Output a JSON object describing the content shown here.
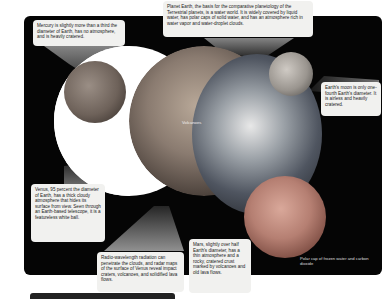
{
  "figure": {
    "callouts": {
      "mercury": "Mercury is slightly more than a third the diameter of Earth, has no atmosphere, and is heavily cratered.",
      "earth": "Planet Earth, the basis for the comparative planetology of the Terrestrial planets, is a water world. It is widely covered by liquid water, has polar caps of solid water, and has an atmosphere rich in water vapor and water-droplet clouds.",
      "moon": "Earth's moon is only one-fourth Earth's diameter. It is airless and heavily cratered.",
      "venus": "Venus, 95 percent the diameter of Earth, has a thick cloudy atmosphere that hides its surface from view. Seen through an Earth-based telescope, it is a featureless white ball.",
      "radio": "Radio-wavelength radiation can penetrate the clouds, and radar maps of the surface of Venus reveal impact craters, volcanoes, and solidified lava flows.",
      "mars": "Mars, slightly over half Earth's diameter, has a thin atmosphere and a rocky, cratered crust marked by volcanoes and old lava flows."
    },
    "labels": {
      "volcanoes": "Volcanoes",
      "polar_cap": "Polar cap of frozen water and carbon dioxide"
    },
    "colors": {
      "background": "#050505",
      "callout": "#f1f1ef",
      "beam": "#8a8a8a"
    }
  }
}
